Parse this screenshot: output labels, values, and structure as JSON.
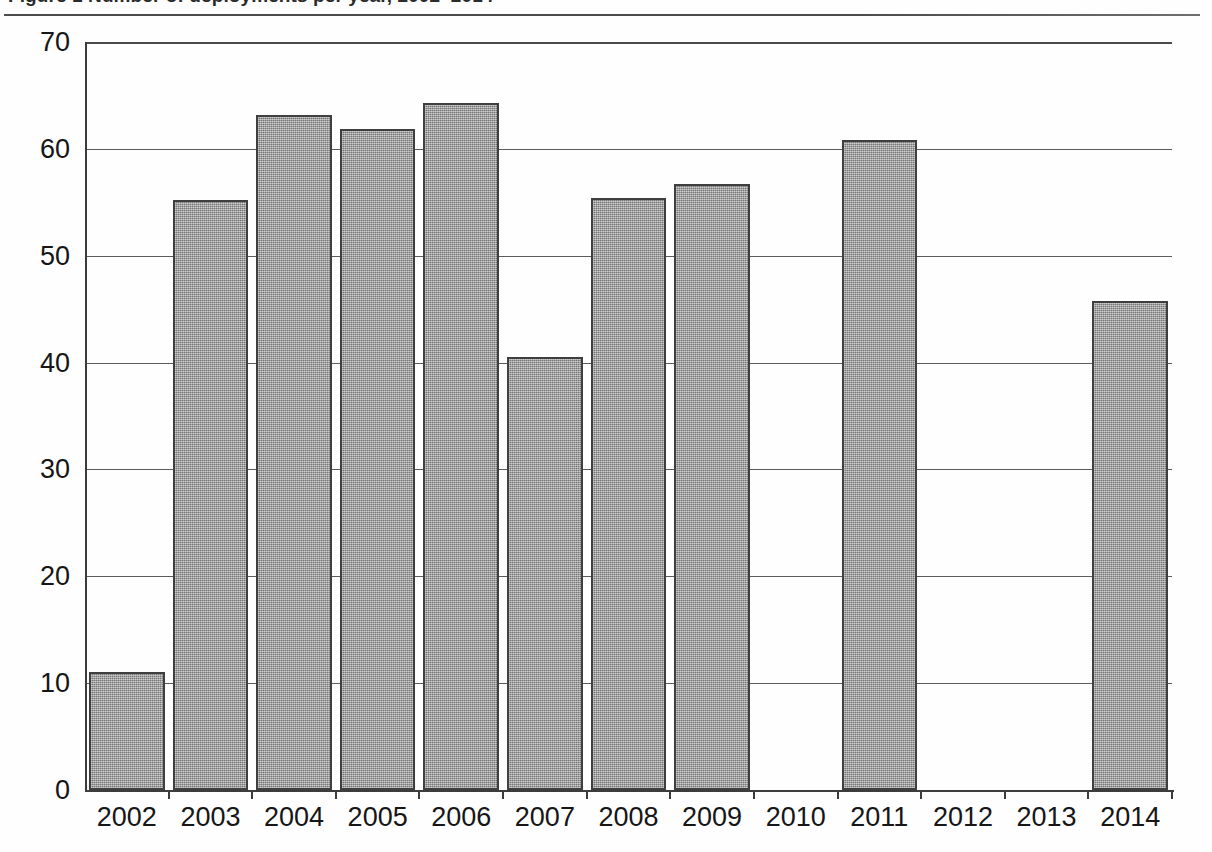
{
  "figure": {
    "caption_partial": "Figure 1  Number of deployments per year, 2002–2014",
    "rule_name": "caption-divider"
  },
  "chart_data": {
    "type": "bar",
    "title": "",
    "xlabel": "",
    "ylabel": "",
    "categories": [
      "2002",
      "2003",
      "2004",
      "2005",
      "2006",
      "2007",
      "2008",
      "2009",
      "2010",
      "2011",
      "2012",
      "2013",
      "2014"
    ],
    "values": [
      11.0,
      55.2,
      63.2,
      61.9,
      64.3,
      40.5,
      55.4,
      56.7,
      0,
      60.8,
      0,
      0,
      45.8
    ],
    "ylim": [
      0,
      70
    ],
    "yticks": [
      0,
      10,
      20,
      30,
      40,
      50,
      60,
      70
    ],
    "ytick_labels": [
      "0",
      "10",
      "20",
      "30",
      "40",
      "50",
      "60",
      "70"
    ],
    "grid": true,
    "grid_axis": "y",
    "legend": "none",
    "bar_fill_color": "#9c9c9c",
    "bar_edge_color": "#3f3f3f",
    "axis_color": "#3c3c3c",
    "missing_categories": [
      "2010",
      "2012",
      "2013"
    ]
  }
}
